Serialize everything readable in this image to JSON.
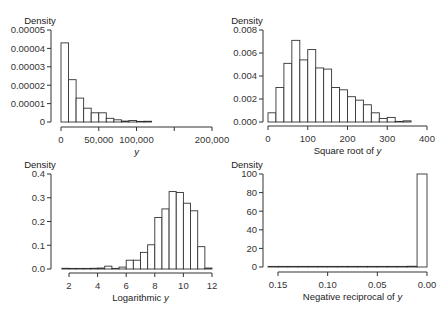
{
  "chart_data": [
    {
      "type": "bar",
      "panel": "top-left",
      "title": "",
      "xlabel": "y",
      "xlabel_italic_part": "y",
      "ylabel": "Density",
      "xlim": [
        0,
        200000
      ],
      "ylim": [
        0,
        5e-05
      ],
      "x_ticks": [
        0,
        50000,
        100000,
        150000,
        200000
      ],
      "x_tick_labels": [
        "0",
        "50,000",
        "100,000",
        "",
        "200,000"
      ],
      "y_ticks": [
        0,
        1e-05,
        2e-05,
        3e-05,
        4e-05,
        5e-05
      ],
      "y_tick_labels": [
        "0",
        "0.00001",
        "0.00002",
        "0.00003",
        "0.00004",
        "0.00005"
      ],
      "bin_width": 10000,
      "bins": [
        0,
        10000,
        20000,
        30000,
        40000,
        50000,
        60000,
        70000,
        80000,
        90000,
        100000,
        110000
      ],
      "values": [
        4.3e-05,
        2.3e-05,
        1.3e-05,
        7.5e-06,
        5e-06,
        5e-06,
        2e-06,
        1.2e-06,
        5e-07,
        8e-07,
        2e-07,
        4e-07
      ]
    },
    {
      "type": "bar",
      "panel": "top-right",
      "title": "",
      "xlabel": "Square root of ",
      "xlabel_italic_part": "y",
      "ylabel": "Density",
      "xlim": [
        0,
        400
      ],
      "ylim": [
        0,
        0.008
      ],
      "x_ticks": [
        0,
        100,
        200,
        300,
        400
      ],
      "x_tick_labels": [
        "0",
        "100",
        "200",
        "300",
        "400"
      ],
      "y_ticks": [
        0,
        0.002,
        0.004,
        0.006,
        0.008
      ],
      "y_tick_labels": [
        "0.000",
        "0.002",
        "0.004",
        "0.006",
        "0.008"
      ],
      "bin_width": 20,
      "bins": [
        0,
        20,
        40,
        60,
        80,
        100,
        120,
        140,
        160,
        180,
        200,
        220,
        240,
        260,
        280,
        300,
        320,
        340
      ],
      "values": [
        0.0008,
        0.003,
        0.0051,
        0.0071,
        0.0054,
        0.0063,
        0.0047,
        0.0046,
        0.003,
        0.0028,
        0.0022,
        0.0019,
        0.0015,
        0.0008,
        0.0003,
        0.0004,
        0.0,
        0.0001
      ]
    },
    {
      "type": "bar",
      "panel": "bottom-left",
      "title": "",
      "xlabel": "Logarithmic ",
      "xlabel_italic_part": "y",
      "ylabel": "Density",
      "xlim": [
        2,
        12
      ],
      "ylim": [
        0,
        0.4
      ],
      "x_ticks": [
        2,
        4,
        6,
        8,
        10,
        12
      ],
      "x_tick_labels": [
        "2",
        "4",
        "6",
        "8",
        "10",
        "12"
      ],
      "y_ticks": [
        0,
        0.1,
        0.2,
        0.3,
        0.4
      ],
      "y_tick_labels": [
        "0.0",
        "0.1",
        "0.2",
        "0.3",
        "0.4"
      ],
      "bin_width": 0.5,
      "bins": [
        1.5,
        2.0,
        2.5,
        3.0,
        3.5,
        4.0,
        4.5,
        5.0,
        5.5,
        6.0,
        6.5,
        7.0,
        7.5,
        8.0,
        8.5,
        9.0,
        9.5,
        10.0,
        10.5,
        11.0,
        11.5
      ],
      "values": [
        0.003,
        0.0005,
        0.0005,
        0.0005,
        0.003,
        0.004,
        0.012,
        0.0,
        0.008,
        0.037,
        0.037,
        0.07,
        0.102,
        0.217,
        0.253,
        0.326,
        0.322,
        0.277,
        0.245,
        0.094,
        0.004
      ]
    },
    {
      "type": "bar",
      "panel": "bottom-right",
      "title": "",
      "xlabel": "Negative reciprocal of ",
      "xlabel_italic_part": "y",
      "ylabel": "Density",
      "xlim": [
        0.15,
        0.0
      ],
      "x_reversed": true,
      "ylim": [
        0,
        100
      ],
      "x_ticks": [
        0.15,
        0.1,
        0.05,
        0.0
      ],
      "x_tick_labels": [
        "0.15",
        "0.10",
        "0.05",
        "0.00"
      ],
      "y_ticks": [
        0,
        20,
        40,
        60,
        80,
        100
      ],
      "y_tick_labels": [
        "0",
        "20",
        "40",
        "60",
        "80",
        "100"
      ],
      "bin_width": 0.01,
      "bins": [
        0.16,
        0.15,
        0.14,
        0.13,
        0.12,
        0.11,
        0.1,
        0.09,
        0.08,
        0.07,
        0.06,
        0.05,
        0.04,
        0.03,
        0.02,
        0.01
      ],
      "values": [
        0.3,
        0.1,
        0.1,
        0.1,
        0.1,
        0.1,
        0.1,
        0.1,
        0.1,
        0.1,
        0.1,
        0.1,
        0.1,
        0.2,
        0.8,
        100
      ]
    }
  ],
  "layout": {
    "panels": [
      {
        "x0": 61,
        "x1": 212,
        "y0": 122,
        "y1": 30,
        "yaxis_x": 51,
        "xaxis_y": 127,
        "ylabel_x": 40,
        "ylabel_y": 24
      },
      {
        "x0": 268,
        "x1": 427,
        "y0": 122,
        "y1": 30,
        "yaxis_x": 263,
        "xaxis_y": 126,
        "ylabel_x": 247,
        "ylabel_y": 24
      },
      {
        "x0": 69,
        "x1": 212,
        "y0": 269,
        "y1": 174,
        "yaxis_x": 51,
        "xaxis_y": 273,
        "ylabel_x": 40,
        "ylabel_y": 168
      },
      {
        "x0": 278,
        "x1": 427,
        "y0": 267,
        "y1": 174,
        "yaxis_x": 263,
        "xaxis_y": 272,
        "ylabel_x": 247,
        "ylabel_y": 168
      }
    ]
  }
}
